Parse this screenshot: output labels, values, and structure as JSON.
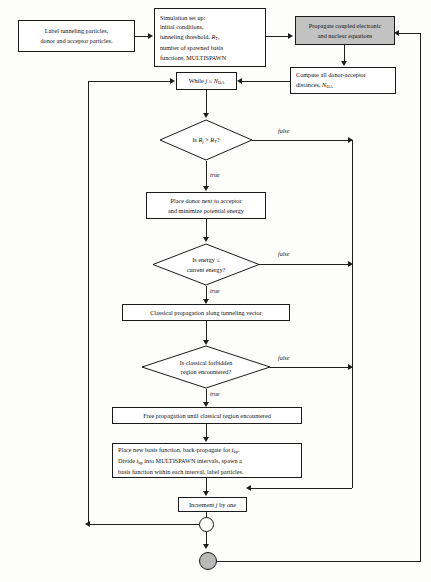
{
  "diagram": {
    "type": "flowchart",
    "colors": {
      "shaded_node_fill": "#c2c2c2",
      "node_fill": "#ffffff",
      "stroke": "#1f1f1f",
      "terminal_fill": "#b9b9b9"
    },
    "nodes": {
      "label_particles": {
        "shape": "process",
        "lines": [
          "Label tunneling particles,",
          "donor and acceptor particles."
        ]
      },
      "simulation_setup": {
        "shape": "process",
        "lines": [
          "Simulation set up:",
          "initial conditions,",
          "tunneling threshold, R",
          "number of spawned basis",
          "functions, MULTISPAWN"
        ],
        "line3_symbol": "R",
        "line3_subscript": "T",
        "line3_suffix": ","
      },
      "propagate_coupled": {
        "shape": "process-shaded",
        "lines": [
          "Propagate coupled electronic",
          "and nuclear equations"
        ]
      },
      "compute_distances": {
        "shape": "process",
        "lines": [
          "Compute all donor-acceptor",
          "distances, N"
        ],
        "line2_symbol": "N",
        "line2_subscript": "DA"
      },
      "while_loop": {
        "shape": "process",
        "text": "While j ≤ N",
        "symbol_j": "j",
        "symbol_n": "N",
        "subscript": "DA"
      },
      "decision_rj": {
        "shape": "decision",
        "text": "Is R",
        "sub1": "j",
        "mid": " > R",
        "sub2": "T",
        "end": "?"
      },
      "place_donor": {
        "shape": "process",
        "lines": [
          "Place donor next to acceptor",
          "and minimize potential energy"
        ]
      },
      "decision_energy": {
        "shape": "decision",
        "lines": [
          "Is energy  ≤",
          "current energy?"
        ]
      },
      "classical_propagation": {
        "shape": "process",
        "lines": [
          "Classical propagation along tunneling vector"
        ]
      },
      "decision_forbidden": {
        "shape": "decision",
        "lines": [
          "Is classical forbidden",
          "region encountered?"
        ]
      },
      "free_propagation": {
        "shape": "process",
        "lines": [
          "Free propagation until classical region encountered"
        ]
      },
      "place_new_basis": {
        "shape": "process",
        "line1_a": "Place new basis function, back-propagate for ",
        "line1_sym": "t",
        "line1_sub": "bp",
        "line1_b": ".",
        "line2_a": "Divide ",
        "line2_sym": "t",
        "line2_sub": "bp",
        "line2_b": " into MULTISPAWN  intervals, spawn a",
        "line3": "basis function within each interval, label particles."
      },
      "increment_j": {
        "shape": "process",
        "text": "Increment j by one",
        "symbol": "j"
      },
      "junction_open": {
        "shape": "circle-open"
      },
      "terminal_filled": {
        "shape": "circle-filled"
      }
    },
    "edge_labels": {
      "false_1": "false",
      "false_2": "false",
      "false_3": "false",
      "true_1": "true",
      "true_2": "true",
      "true_3": "true"
    }
  }
}
